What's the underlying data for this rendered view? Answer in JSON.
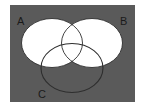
{
  "diagram": {
    "type": "venn",
    "background_color": "#5a5a5a",
    "fill_color": "#ffffff",
    "outline_color": "#2e2e2e",
    "sets": [
      {
        "id": "A",
        "label": "A",
        "filled": true
      },
      {
        "id": "B",
        "label": "B",
        "filled": true
      },
      {
        "id": "C",
        "label": "C",
        "filled": false
      }
    ]
  }
}
